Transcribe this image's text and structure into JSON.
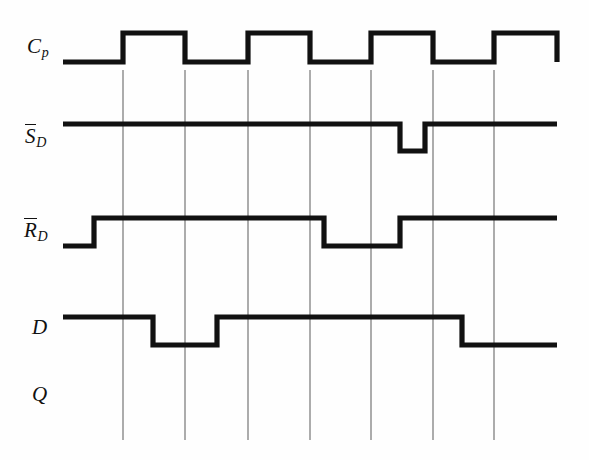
{
  "figure": {
    "kind": "digital-timing-diagram",
    "width": 589,
    "height": 460,
    "background_color": "#fefefe",
    "waveform_color": "#111111",
    "gridline_color": "#5a5a5a"
  },
  "labels": {
    "clock": {
      "base": "C",
      "sub": "p",
      "overbar": false,
      "text": "Cp"
    },
    "set_bar": {
      "base": "S",
      "sub": "D",
      "overbar": true,
      "text": "S̅D"
    },
    "reset_bar": {
      "base": "R",
      "sub": "D",
      "overbar": true,
      "text": "R̅D"
    },
    "data": {
      "base": "D",
      "sub": "",
      "overbar": false,
      "text": "D"
    },
    "output": {
      "base": "Q",
      "sub": "",
      "overbar": false,
      "text": "Q"
    }
  },
  "chart_data": {
    "type": "line",
    "title": "",
    "xlabel": "",
    "ylabel": "",
    "grid": true,
    "legend_position": "left-axis-labels",
    "x_axis": {
      "units": "clock edges",
      "gridlines_x_px": [
        123,
        185,
        248,
        310,
        371,
        433,
        494
      ],
      "plot_x_start_px": 63,
      "plot_x_end_px": 557
    },
    "signals": [
      {
        "name": "Cp",
        "label": "Cp",
        "row_index": 0,
        "high_y_px": 33,
        "low_y_px": 62,
        "initial_level": 0,
        "transitions_x_px": [
          123,
          185,
          248,
          310,
          371,
          433,
          494,
          557
        ],
        "levels": [
          0,
          1,
          0,
          1,
          0,
          1,
          0,
          1,
          0
        ],
        "description": "Clock with four positive pulses"
      },
      {
        "name": "SD_bar",
        "label": "S̅D",
        "row_index": 1,
        "high_y_px": 124,
        "low_y_px": 151,
        "initial_level": 1,
        "transitions_x_px": [
          400,
          425
        ],
        "levels": [
          1,
          0,
          1
        ],
        "description": "Active-low asynchronous set, one narrow low pulse"
      },
      {
        "name": "RD_bar",
        "label": "R̅D",
        "row_index": 2,
        "high_y_px": 218,
        "low_y_px": 246,
        "initial_level": 0,
        "transitions_x_px": [
          94,
          324,
          400
        ],
        "levels": [
          0,
          1,
          0,
          1
        ],
        "description": "Active-low asynchronous reset, low at start and mid-frame"
      },
      {
        "name": "D",
        "label": "D",
        "row_index": 3,
        "high_y_px": 317,
        "low_y_px": 345,
        "initial_level": 1,
        "transitions_x_px": [
          153,
          217,
          462
        ],
        "levels": [
          1,
          0,
          1,
          0
        ],
        "description": "Data input"
      },
      {
        "name": "Q",
        "label": "Q",
        "row_index": 4,
        "high_y_px": 380,
        "low_y_px": 408,
        "initial_level": null,
        "transitions_x_px": [],
        "levels": [],
        "description": "Output row left blank to be completed"
      }
    ]
  },
  "row_label_positions": [
    {
      "name": "clock",
      "left_px": 27,
      "top_px": 36
    },
    {
      "name": "set_bar",
      "left_px": 25,
      "top_px": 126
    },
    {
      "name": "reset_bar",
      "left_px": 24,
      "top_px": 220
    },
    {
      "name": "data",
      "left_px": 32,
      "top_px": 318
    },
    {
      "name": "output",
      "left_px": 32,
      "top_px": 385
    }
  ]
}
